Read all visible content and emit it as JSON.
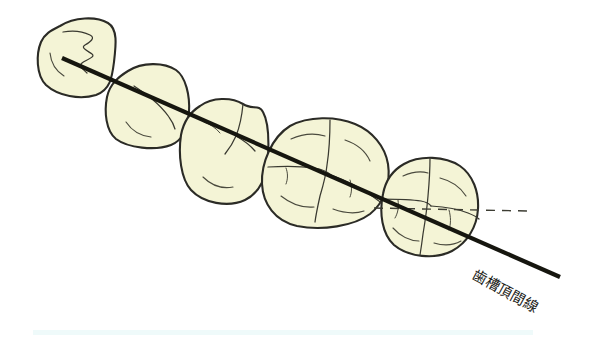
{
  "figure": {
    "title": "歯槽頂間線",
    "background_color": "#ffffff",
    "tooth_fill_color": "#f4f4d6",
    "tooth_outline_color": "#2b2b26",
    "crest_line_color": "#16160f",
    "dashed_line_color": "#3d3d33",
    "bottom_strip_color": "#effafa"
  },
  "labels": {
    "crest_line": "歯槽頂間線"
  },
  "chart_data": {
    "type": "diagram",
    "title": "歯槽頂間線",
    "annotations": [
      {
        "name": "crest-line",
        "label": "歯槽頂間線",
        "type": "solid-line",
        "x1": 62,
        "y1": 58,
        "x2": 560,
        "y2": 277,
        "angle_deg": 23.7,
        "stroke_width": 4.2,
        "color": "#16160f"
      },
      {
        "name": "horizontal-reference-line",
        "label": "",
        "type": "dashed-line",
        "x1": 374,
        "y1": 208,
        "x2": 527,
        "y2": 211,
        "angle_deg": 1.1,
        "stroke_width": 1.4,
        "color": "#3d3d33"
      }
    ],
    "teeth": [
      {
        "index": 1,
        "name": "first-premolar",
        "cusps": 2,
        "bbox": [
          38,
          18,
          78,
          78
        ],
        "center": [
          77,
          57
        ]
      },
      {
        "index": 2,
        "name": "second-premolar",
        "cusps": 2,
        "bbox": [
          103,
          63,
          88,
          86
        ],
        "center": [
          147,
          106
        ]
      },
      {
        "index": 3,
        "name": "third-tooth",
        "cusps": 2,
        "bbox": [
          180,
          98,
          89,
          108
        ],
        "center": [
          224,
          152
        ]
      },
      {
        "index": 4,
        "name": "first-molar",
        "cusps": 4,
        "bbox": [
          262,
          118,
          127,
          111
        ],
        "center": [
          325,
          173
        ]
      },
      {
        "index": 5,
        "name": "second-molar",
        "cusps": 4,
        "bbox": [
          382,
          155,
          97,
          101
        ],
        "center": [
          430,
          205
        ]
      }
    ]
  }
}
